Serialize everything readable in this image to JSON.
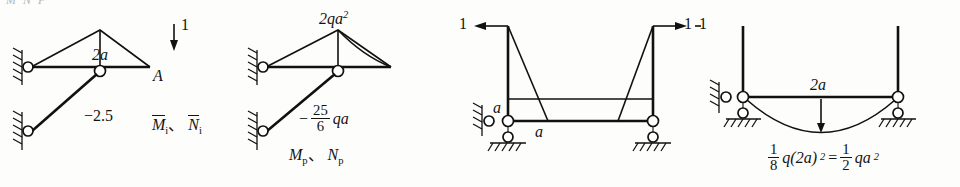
{
  "figure": {
    "background_color": "#fdfdfb",
    "line_color": "#111111",
    "top_cropped_text": "M  N     P"
  },
  "panels": [
    {
      "id": "mi-ni",
      "name": "unit-state-diagram",
      "caption": "M̄i、N̄i",
      "caption_parts": {
        "first_symbol": "M",
        "first_subscript": "i",
        "separator": "、",
        "second_symbol": "N",
        "second_subscript": "i"
      },
      "labels": {
        "span": "2a",
        "force": "1",
        "point": "A",
        "axial": "−2.5"
      },
      "force_direction": "down",
      "supports": [
        "pin-wall-upper",
        "pin-wall-lower"
      ]
    },
    {
      "id": "mp-np",
      "name": "real-load-diagram",
      "caption": "Mp、Np",
      "caption_parts": {
        "first_symbol": "M",
        "first_subscript": "p",
        "separator": "、",
        "second_symbol": "N",
        "second_subscript": "p"
      },
      "labels": {
        "moment_peak": "2qa²",
        "moment_peak_base": "2qa",
        "moment_peak_exp": "2",
        "axial_sign": "−",
        "axial_num": "25",
        "axial_den": "6",
        "axial_unit": "qa"
      },
      "supports": [
        "pin-wall-upper",
        "pin-wall-lower"
      ]
    },
    {
      "id": "unit-load-frame",
      "name": "unit-load-frame-diagram",
      "labels": {
        "left_force": "1",
        "right_force": "1",
        "height_label": "a",
        "length_label": "a"
      },
      "left_force_direction": "left",
      "right_force_direction": "right",
      "supports": [
        "pin-wall-left",
        "roller-left",
        "roller-right"
      ]
    },
    {
      "id": "udl-frame",
      "name": "distributed-load-frame-diagram",
      "labels": {
        "span": "2a",
        "formula_frac1_num": "1",
        "formula_frac1_den": "8",
        "formula_mid": "q(2a)",
        "formula_mid_exp": "2",
        "formula_equals": "=",
        "formula_frac2_num": "1",
        "formula_frac2_den": "2",
        "formula_tail": "qa",
        "formula_tail_exp": "2",
        "formula_plain": "1/8 q(2a)² = 1/2 qa²",
        "left_force": "1"
      },
      "supports": [
        "pin-wall-left",
        "roller-left",
        "roller-right"
      ]
    }
  ]
}
